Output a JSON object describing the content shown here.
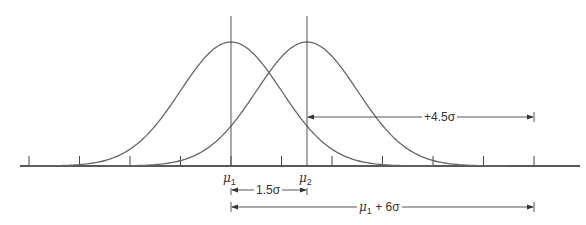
{
  "diagram": {
    "axis": {
      "tick_count": 11,
      "sigma_px": 50.5
    },
    "curves": [
      {
        "name": "distribution-1",
        "mean_label": "μ",
        "mean_sub": "1"
      },
      {
        "name": "distribution-2",
        "mean_label": "μ",
        "mean_sub": "2"
      }
    ],
    "annotations": {
      "shift": "1.5σ",
      "upper_spec_from_mu2": "+4.5σ",
      "upper_spec_from_mu1_prefix": "μ",
      "upper_spec_from_mu1_sub": "1",
      "upper_spec_from_mu1_suffix": " + 6σ"
    },
    "colors": {
      "line": "#555555",
      "axis": "#222222"
    }
  }
}
